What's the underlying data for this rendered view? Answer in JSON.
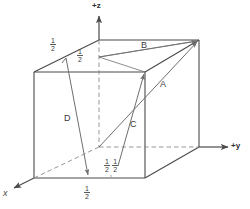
{
  "figure": {
    "background": "#ffffff",
    "line_color": "#4a4a4a",
    "vector_color": "#6f6f6f",
    "dashed_color": "#8a8a8a",
    "text_color": "#3a3a3a",
    "width": 250,
    "height": 209
  },
  "axes": {
    "z": {
      "label": "+z"
    },
    "y": {
      "label": "+y"
    },
    "x": {
      "label": "x"
    }
  },
  "vectors": [
    {
      "name": "A",
      "label": "A"
    },
    {
      "name": "B",
      "label": "B"
    },
    {
      "name": "C",
      "label": "C"
    },
    {
      "name": "D",
      "label": "D"
    }
  ],
  "fractions": {
    "top_left": {
      "numerator": "1",
      "denominator": "2"
    },
    "top_inner": {
      "numerator": "1",
      "denominator": "2"
    },
    "bottom_center": {
      "numerator": "1",
      "denominator": "2"
    },
    "origin_pair_first": {
      "numerator": "1",
      "denominator": "2"
    },
    "origin_pair_second": {
      "numerator": "1",
      "denominator": "2"
    },
    "separator": ","
  }
}
